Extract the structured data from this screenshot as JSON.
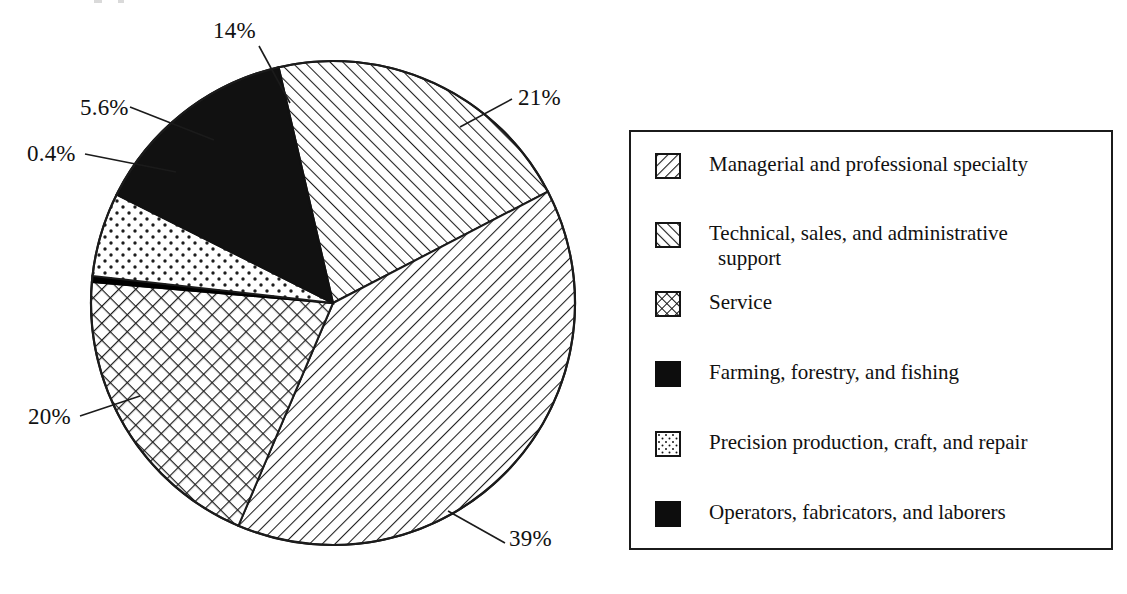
{
  "chart_data": {
    "type": "pie",
    "title": "",
    "categories": [
      "Managerial and professional specialty",
      "Technical, sales, and administrative support",
      "Service",
      "Farming, forestry, and fishing",
      "Precision production, craft, and repair",
      "Operators, fabricators, and laborers"
    ],
    "values": [
      39,
      21,
      20,
      0.4,
      5.6,
      14
    ],
    "value_labels": [
      "39%",
      "21%",
      "20%",
      "0.4%",
      "5.6%",
      "14%"
    ],
    "units": "percent",
    "legend_position": "right",
    "grid": false,
    "colors": {
      "managerial": "#ffffff",
      "technical": "#ffffff",
      "service": "#ffffff",
      "farming": "#000000",
      "precision": "#ffffff",
      "operators": "#000000",
      "outline": "#1b1b1b"
    },
    "patterns": [
      "diagonal-hatch-left",
      "diagonal-hatch-right",
      "cross-hatch",
      "solid-black",
      "dotted",
      "solid-black"
    ]
  },
  "pie": {
    "labels": {
      "operators": "14%",
      "precision": "5.6%",
      "farming": "0.4%",
      "technical": "21%",
      "service": "20%",
      "managerial": "39%"
    }
  },
  "legend": {
    "items": [
      {
        "label": "Managerial and professional specialty",
        "label_cont": "",
        "swatch": "diagonal-hatch-left-swatch"
      },
      {
        "label": "Technical, sales, and administrative",
        "label_cont": "support",
        "swatch": "diagonal-hatch-right-swatch"
      },
      {
        "label": "Service",
        "label_cont": "",
        "swatch": "cross-hatch-swatch"
      },
      {
        "label": "Farming, forestry, and fishing",
        "label_cont": "",
        "swatch": "solid-black-swatch"
      },
      {
        "label": "Precision production, craft, and repair",
        "label_cont": "",
        "swatch": "dotted-swatch"
      },
      {
        "label": "Operators, fabricators, and laborers",
        "label_cont": "",
        "swatch": "solid-black-swatch"
      }
    ]
  }
}
